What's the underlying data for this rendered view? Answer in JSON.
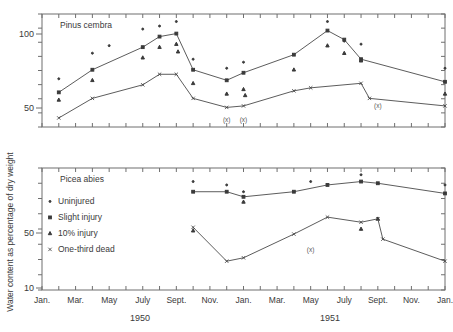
{
  "figure": {
    "ylabel": "Water content as percentage of dry weight",
    "year_labels": [
      {
        "text": "1950",
        "x": 140
      },
      {
        "text": "1951",
        "x": 330
      }
    ],
    "month_labels": [
      "Jan.",
      "Mar.",
      "May",
      "July",
      "Sept.",
      "Nov.",
      "Jan.",
      "Mar.",
      "May",
      "July",
      "Sept.",
      "Nov.",
      "Jan."
    ],
    "legend": {
      "items": [
        {
          "label": "Uninjured",
          "marker": "dot-small"
        },
        {
          "label": "Slight injury",
          "marker": "square"
        },
        {
          "label": "10% injury",
          "marker": "triangle"
        },
        {
          "label": "One-third dead",
          "marker": "cross"
        }
      ]
    },
    "panels": [
      {
        "species": "Pinus cembra",
        "ytick_labels": [
          "100",
          "50"
        ],
        "annotations": [
          {
            "text": "(x)",
            "month": 11
          },
          {
            "text": "(x)",
            "month": 12
          },
          {
            "text": "(x)",
            "month": 20
          }
        ]
      },
      {
        "species": "Picea abies",
        "ytick_labels": [
          "50",
          "10"
        ],
        "annotations": [
          {
            "text": "(x)",
            "month": 16
          }
        ]
      }
    ]
  },
  "chart_data": [
    {
      "type": "line",
      "title": "Pinus cembra",
      "xlabel": "",
      "ylabel": "Water content as percentage of dry weight",
      "ylim": [
        40,
        115
      ],
      "xlim": [
        0,
        25
      ],
      "grid": false,
      "legend": [
        "Uninjured",
        "Slight injury",
        "10% injury",
        "One-third dead"
      ],
      "x": [
        "Jan. 1950",
        "Feb. 1950",
        "Mar. 1950",
        "Apr. 1950",
        "May 1950",
        "June 1950",
        "July 1950",
        "Aug. 1950",
        "Sept. 1950",
        "Oct. 1950",
        "Nov. 1950",
        "Dec. 1950",
        "Jan. 1951",
        "Feb. 1951",
        "Mar. 1951",
        "Apr. 1951",
        "May 1951",
        "June 1951",
        "July 1951",
        "Aug. 1951",
        "Sept. 1951",
        "Oct. 1951",
        "Nov. 1951",
        "Dec. 1951",
        "Jan. 1952"
      ],
      "series": [
        {
          "name": "Uninjured",
          "marker": "dot-small",
          "points": [
            {
              "month": 1,
              "value": 72
            },
            {
              "month": 3,
              "value": 89
            },
            {
              "month": 4,
              "value": 94
            },
            {
              "month": 6,
              "value": 105
            },
            {
              "month": 7,
              "value": 107
            },
            {
              "month": 8,
              "value": 110
            },
            {
              "month": 9,
              "value": 85
            },
            {
              "month": 11,
              "value": 79
            },
            {
              "month": 12,
              "value": 83
            },
            {
              "month": 17,
              "value": 110
            },
            {
              "month": 18,
              "value": 97
            },
            {
              "month": 19,
              "value": 95
            },
            {
              "month": 24,
              "value": 79
            }
          ]
        },
        {
          "name": "Slight injury",
          "marker": "square",
          "connected": true,
          "points": [
            {
              "month": 1,
              "value": 63
            },
            {
              "month": 3,
              "value": 78
            },
            {
              "month": 6,
              "value": 93
            },
            {
              "month": 7,
              "value": 100
            },
            {
              "month": 8,
              "value": 102
            },
            {
              "month": 9,
              "value": 78
            },
            {
              "month": 11,
              "value": 71
            },
            {
              "month": 12,
              "value": 76
            },
            {
              "month": 15,
              "value": 88
            },
            {
              "month": 17,
              "value": 104
            },
            {
              "month": 18,
              "value": 98
            },
            {
              "month": 19,
              "value": 85
            },
            {
              "month": 24,
              "value": 70
            }
          ]
        },
        {
          "name": "10% injury",
          "marker": "triangle",
          "points": [
            {
              "month": 1,
              "value": 58
            },
            {
              "month": 3,
              "value": 71
            },
            {
              "month": 6,
              "value": 86
            },
            {
              "month": 7,
              "value": 93
            },
            {
              "month": 8,
              "value": 95
            },
            {
              "month": 8.1,
              "value": 90
            },
            {
              "month": 9,
              "value": 69
            },
            {
              "month": 11,
              "value": 62
            },
            {
              "month": 12,
              "value": 65
            },
            {
              "month": 12.1,
              "value": 61
            },
            {
              "month": 15,
              "value": 78
            },
            {
              "month": 17,
              "value": 94
            },
            {
              "month": 18,
              "value": 89
            },
            {
              "month": 19,
              "value": 84
            },
            {
              "month": 24,
              "value": 62
            }
          ]
        },
        {
          "name": "One-third dead",
          "marker": "cross",
          "connected": true,
          "points": [
            {
              "month": 1,
              "value": 46
            },
            {
              "month": 3,
              "value": 59
            },
            {
              "month": 6,
              "value": 68
            },
            {
              "month": 7,
              "value": 75
            },
            {
              "month": 8,
              "value": 75
            },
            {
              "month": 9,
              "value": 59
            },
            {
              "month": 11,
              "value": 53
            },
            {
              "month": 12,
              "value": 54
            },
            {
              "month": 15,
              "value": 64
            },
            {
              "month": 16,
              "value": 66
            },
            {
              "month": 19,
              "value": 69
            },
            {
              "month": 19.5,
              "value": 59
            },
            {
              "month": 24,
              "value": 54
            }
          ]
        }
      ]
    },
    {
      "type": "line",
      "title": "Picea abies",
      "xlabel": "",
      "ylabel": "Water content as percentage of dry weight",
      "ylim": [
        8,
        80
      ],
      "xlim": [
        0,
        25
      ],
      "grid": false,
      "legend": [
        "Uninjured",
        "Slight injury",
        "10% injury",
        "One-third dead"
      ],
      "x": [
        "Jan. 1950",
        "Feb. 1950",
        "Mar. 1950",
        "Apr. 1950",
        "May 1950",
        "June 1950",
        "July 1950",
        "Aug. 1950",
        "Sept. 1950",
        "Oct. 1950",
        "Nov. 1950",
        "Dec. 1950",
        "Jan. 1951",
        "Feb. 1951",
        "Mar. 1951",
        "Apr. 1951",
        "May 1951",
        "June 1951",
        "July 1951",
        "Aug. 1951",
        "Sept. 1951",
        "Oct. 1951",
        "Nov. 1951",
        "Dec. 1951",
        "Jan. 1952"
      ],
      "series": [
        {
          "name": "Uninjured",
          "marker": "dot-small",
          "points": [
            {
              "month": 9,
              "value": 72
            },
            {
              "month": 11,
              "value": 70
            },
            {
              "month": 12,
              "value": 66
            },
            {
              "month": 16,
              "value": 72
            },
            {
              "month": 19,
              "value": 76
            },
            {
              "month": 24,
              "value": 70
            }
          ]
        },
        {
          "name": "Slight injury",
          "marker": "square",
          "connected": true,
          "points": [
            {
              "month": 9,
              "value": 66
            },
            {
              "month": 11,
              "value": 66
            },
            {
              "month": 12,
              "value": 63
            },
            {
              "month": 15,
              "value": 66
            },
            {
              "month": 17,
              "value": 70
            },
            {
              "month": 19,
              "value": 72
            },
            {
              "month": 20,
              "value": 71
            },
            {
              "month": 24,
              "value": 65
            }
          ]
        },
        {
          "name": "10% injury",
          "marker": "triangle",
          "points": [
            {
              "month": 9,
              "value": 43
            },
            {
              "month": 12,
              "value": 60
            },
            {
              "month": 19,
              "value": 44
            },
            {
              "month": 20,
              "value": 50
            }
          ]
        },
        {
          "name": "One-third dead",
          "marker": "cross",
          "connected": true,
          "points": [
            {
              "month": 9,
              "value": 45
            },
            {
              "month": 11,
              "value": 25
            },
            {
              "month": 12,
              "value": 27
            },
            {
              "month": 15,
              "value": 41
            },
            {
              "month": 17,
              "value": 51
            },
            {
              "month": 19,
              "value": 48
            },
            {
              "month": 20,
              "value": 50
            },
            {
              "month": 20.3,
              "value": 38
            },
            {
              "month": 24,
              "value": 25
            }
          ]
        }
      ]
    }
  ]
}
